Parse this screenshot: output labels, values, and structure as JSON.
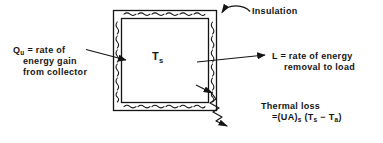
{
  "figure": {
    "background_color": "#ffffff",
    "line_color": "#141414"
  },
  "tank": {
    "center_label": {
      "symbol": "T",
      "subscript": "s"
    },
    "wall_name": "insulated-tank-wall",
    "outer": {
      "x": 113,
      "y": 10,
      "width": 104,
      "height": 101
    },
    "inner": {
      "x": 121,
      "y": 18,
      "width": 88,
      "height": 85
    }
  },
  "labels": {
    "insulation": "Insulation",
    "q_input": {
      "symbol": "Q",
      "subscript": "u",
      "line1": "= rate of",
      "line2": "energy gain",
      "line3": "from collector"
    },
    "load_output": {
      "line1": "L = rate of energy",
      "line2": "removal to load"
    },
    "thermal_loss": {
      "line1": "Thermal loss",
      "line2_prefix": "=(UA)",
      "line2_sub1": "s",
      "line2_mid": " (T",
      "line2_sub2": "s",
      "line2_minus": " − T",
      "line2_sub3": "a",
      "line2_end": ")"
    }
  },
  "arrows": {
    "q_input_arrow": "arrow pointing right into left wall",
    "load_output_arrow": "arrow pointing right out of right wall",
    "insulation_leader": "curved leader from label to top wall",
    "thermal_loss_leader": "zigzag wavy arrow from bottom-right corner"
  }
}
